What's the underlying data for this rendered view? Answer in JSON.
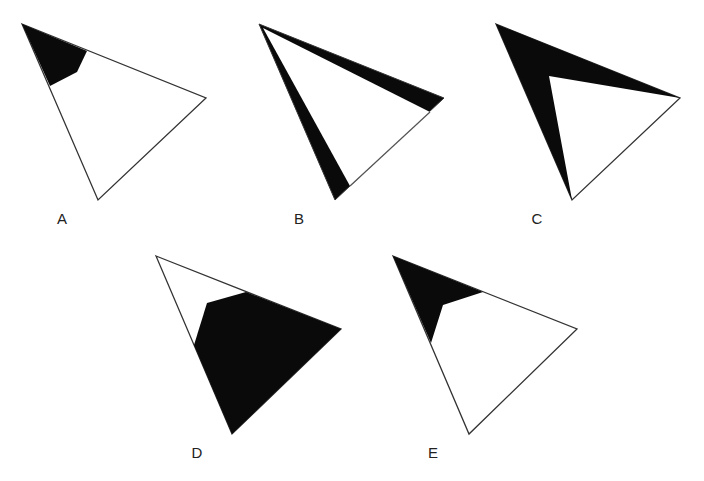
{
  "figures": [
    {
      "label": "A",
      "label_pos": [
        62,
        218
      ],
      "outline": "22,24 206,98 98,200",
      "shaded": "22,24 87,51 77,72 50,86"
    },
    {
      "label": "B",
      "label_pos": [
        299,
        218
      ],
      "outline": "259,24 444,98 335,200",
      "shaded": "259,24 444,98 335,200",
      "inner_white": "263,28 430,112 350,186"
    },
    {
      "label": "C",
      "label_pos": [
        537,
        218
      ],
      "outline": "496,24 680,98 572,200",
      "shaded": "496,24 680,98 549,76 572,200"
    },
    {
      "label": "D",
      "label_pos": [
        197,
        452
      ],
      "outline": "156,256 341,329 232,434",
      "shaded": "246,292 341,329 232,434 194,345 207,303"
    },
    {
      "label": "E",
      "label_pos": [
        433,
        452
      ],
      "outline": "393,256 577,329 469,434",
      "shaded": "393,256 483,292 443,305 431,343"
    }
  ],
  "colors": {
    "shade": "#0a0a0a",
    "stroke": "#333333",
    "background": "#ffffff"
  }
}
